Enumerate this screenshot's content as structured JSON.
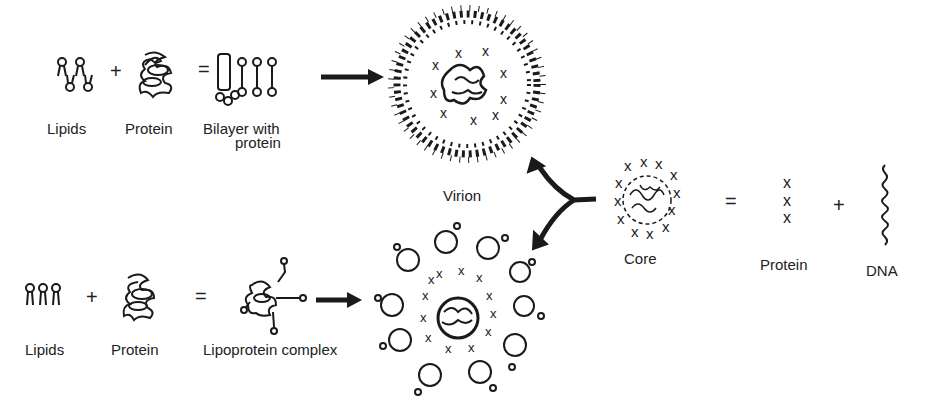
{
  "diagram": {
    "top_row": {
      "components": [
        {
          "label": "Lipids",
          "icon": "lipids-icon"
        },
        {
          "label": "Protein",
          "icon": "protein-coil-icon"
        },
        {
          "label": "Bilayer with",
          "label2": "protein",
          "icon": "bilayer-with-protein-icon"
        }
      ],
      "plus": "+",
      "equals": "=",
      "result": {
        "label": "Virion",
        "icon": "virion-icon"
      }
    },
    "bottom_row": {
      "components": [
        {
          "label": "Lipids",
          "icon": "lipids-icon"
        },
        {
          "label": "Protein",
          "icon": "protein-coil-icon"
        },
        {
          "label": "Lipoprotein complex",
          "icon": "lipoprotein-complex-icon"
        }
      ],
      "plus": "+",
      "equals": "=",
      "result": {
        "label": "",
        "icon": "lipoprotein-particle-icon"
      }
    },
    "core": {
      "label": "Core",
      "equals": "=",
      "plus": "+",
      "parts": [
        {
          "label": "Protein",
          "icon": "protein-x-icon"
        },
        {
          "label": "DNA",
          "icon": "dna-coil-icon"
        }
      ]
    },
    "colors": {
      "ink": "#1a1a1a",
      "background": "#ffffff"
    }
  }
}
